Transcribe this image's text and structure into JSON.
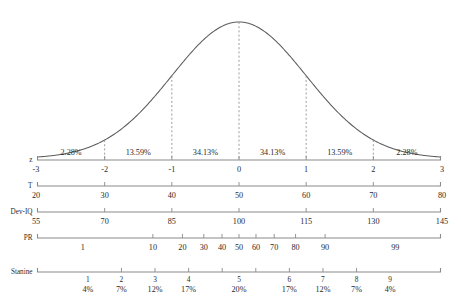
{
  "chart_data": {
    "type": "line",
    "title": "",
    "subtitle": "",
    "xlabel": "",
    "ylabel": "",
    "grid": false,
    "legend": "none",
    "curve": {
      "name": "Standard normal distribution",
      "distribution": "normal",
      "mean": 0,
      "sd": 1,
      "xlim": [
        -3,
        3
      ],
      "ylim": [
        0,
        0.4
      ]
    },
    "dashed_verticals_at_z": [
      -2,
      -1,
      0,
      1,
      2
    ],
    "region_percentages": {
      "labels": [
        "2.28%",
        "13.59%",
        "34.13%",
        "34.13%",
        "13.59%",
        "2.28%"
      ],
      "values": [
        2.28,
        13.59,
        34.13,
        34.13,
        13.59,
        2.28
      ],
      "bounds_z": [
        [
          -3,
          -2
        ],
        [
          -2,
          -1
        ],
        [
          -1,
          0
        ],
        [
          0,
          1
        ],
        [
          1,
          2
        ],
        [
          2,
          3
        ]
      ]
    },
    "scales": [
      {
        "name": "z",
        "label": "z",
        "ticks": [
          "-3",
          "-2",
          "-1",
          "0",
          "1",
          "2",
          "3"
        ],
        "values": [
          -3,
          -2,
          -1,
          0,
          1,
          2,
          3
        ],
        "z_positions": [
          -3,
          -2,
          -1,
          0,
          1,
          2,
          3
        ]
      },
      {
        "name": "T",
        "label": "T",
        "ticks": [
          "20",
          "30",
          "40",
          "50",
          "60",
          "70",
          "80"
        ],
        "values": [
          20,
          30,
          40,
          50,
          60,
          70,
          80
        ],
        "z_positions": [
          -3,
          -2,
          -1,
          0,
          1,
          2,
          3
        ]
      },
      {
        "name": "Dev-IQ",
        "label": "Dev-IQ",
        "ticks": [
          "55",
          "70",
          "85",
          "100",
          "115",
          "130",
          "145"
        ],
        "values": [
          55,
          70,
          85,
          100,
          115,
          130,
          145
        ],
        "z_positions": [
          -3,
          -2,
          -1,
          0,
          1,
          2,
          3
        ]
      },
      {
        "name": "PR",
        "label": "PR",
        "ticks": [
          "1",
          "10",
          "20",
          "30",
          "40",
          "50",
          "60",
          "70",
          "80",
          "90",
          "99"
        ],
        "values": [
          1,
          10,
          20,
          30,
          40,
          50,
          60,
          70,
          80,
          90,
          99
        ],
        "z_positions": [
          -2.326,
          -1.282,
          -0.842,
          -0.524,
          -0.253,
          0,
          0.253,
          0.524,
          0.842,
          1.282,
          2.326
        ]
      }
    ],
    "stanine": {
      "label": "Stanine",
      "numbers": [
        "1",
        "2",
        "3",
        "4",
        "5",
        "6",
        "7",
        "8",
        "9"
      ],
      "percents": [
        "4%",
        "7%",
        "12%",
        "17%",
        "20%",
        "17%",
        "12%",
        "7%",
        "4%"
      ],
      "percent_values": [
        4,
        7,
        12,
        17,
        20,
        17,
        12,
        7,
        4
      ],
      "centers_z": [
        -2.25,
        -1.75,
        -1.25,
        -0.75,
        0,
        0.75,
        1.25,
        1.75,
        2.25
      ],
      "boundaries_z": [
        -1.75,
        -1.25,
        -0.75,
        -0.25,
        0.25,
        0.75,
        1.25,
        1.75
      ]
    },
    "colors": {
      "curve": "#5c5c5c",
      "axis": "#8a8a8a",
      "dashed": "#8d8d8d",
      "text": "#2b2b2b",
      "background": "#ffffff"
    }
  }
}
